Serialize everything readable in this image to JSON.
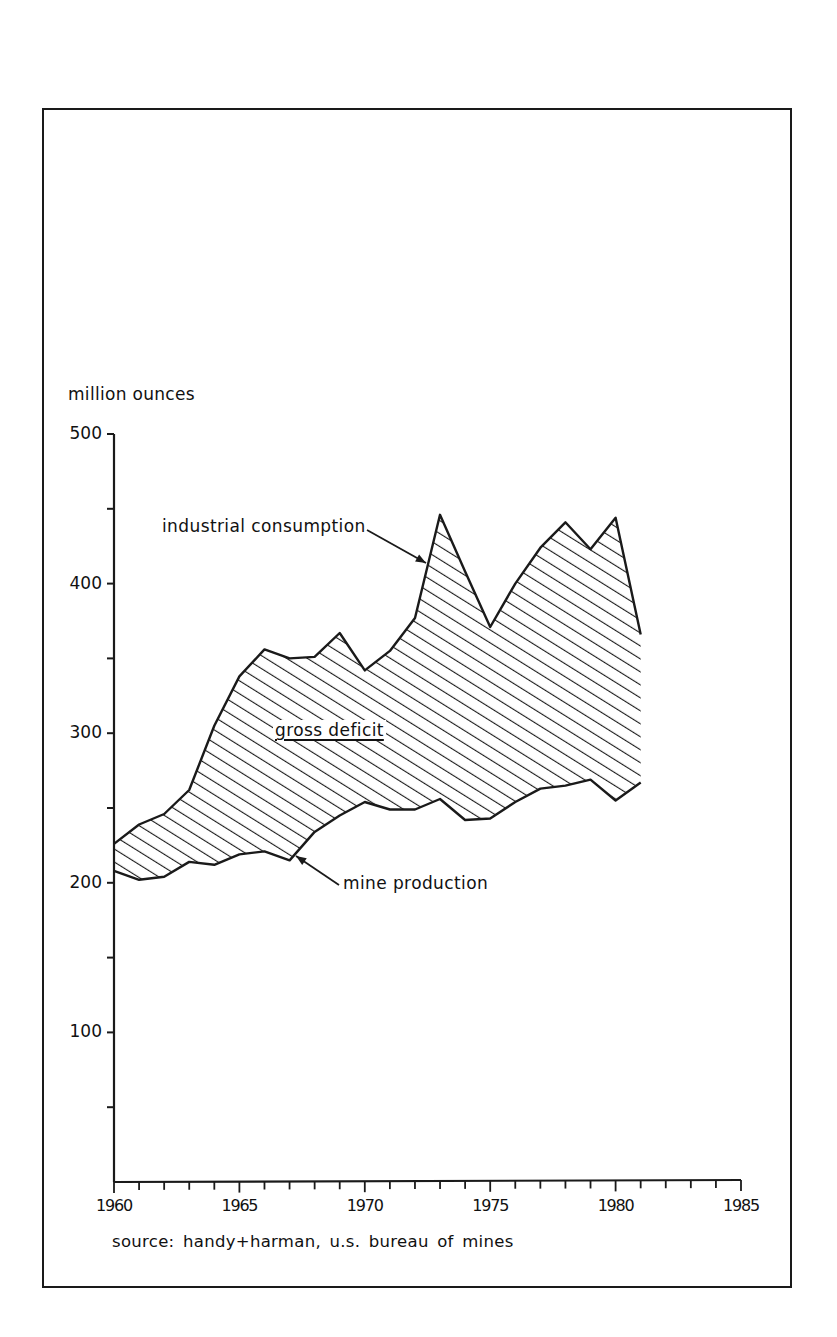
{
  "chart": {
    "y_axis_title": "million ounces",
    "source": "source:  handy+harman,  u.s. bureau of mines",
    "annotations": {
      "upper": "industrial consumption",
      "gap": "gross deficit",
      "lower": "mine production"
    },
    "y_ticks": [
      "500",
      "400",
      "300",
      "200",
      "100"
    ],
    "x_ticks": [
      "1960",
      "1965",
      "1970",
      "1975",
      "1980",
      "1985"
    ]
  },
  "chart_data": {
    "type": "area",
    "title": "",
    "xlabel": "",
    "ylabel": "million ounces",
    "xlim": [
      1960,
      1985
    ],
    "ylim": [
      0,
      500
    ],
    "x_tick_labels": [
      "1960",
      "1965",
      "1970",
      "1975",
      "1980",
      "1985"
    ],
    "x_minor_ticks": "yearly",
    "y_tick_labels": [
      "100",
      "200",
      "300",
      "400",
      "500"
    ],
    "y_minor_ticks": 50,
    "grid": false,
    "legend": "none (inline annotations with arrows)",
    "x": [
      1960,
      1961,
      1962,
      1963,
      1964,
      1965,
      1966,
      1967,
      1968,
      1969,
      1970,
      1971,
      1972,
      1973,
      1974,
      1975,
      1976,
      1977,
      1978,
      1979,
      1980,
      1981
    ],
    "series": [
      {
        "name": "industrial consumption",
        "values": [
          226,
          239,
          246,
          262,
          305,
          338,
          356,
          350,
          351,
          367,
          342,
          355,
          377,
          446,
          408,
          371,
          400,
          424,
          441,
          423,
          444,
          366
        ]
      },
      {
        "name": "mine production",
        "values": [
          208,
          202,
          204,
          214,
          212,
          219,
          221,
          215,
          234,
          245,
          254,
          249,
          249,
          256,
          242,
          243,
          254,
          263,
          265,
          269,
          255,
          267
        ]
      }
    ],
    "fill_between": {
      "name": "gross deficit",
      "upper": "industrial consumption",
      "lower": "mine production",
      "style": "diagonal hatching"
    },
    "annotations": [
      "industrial consumption",
      "gross deficit",
      "mine production"
    ],
    "source": "source: handy+harman, u.s. bureau of mines"
  },
  "colors": {
    "ink": "#1a1a1a",
    "background": "#ffffff"
  }
}
